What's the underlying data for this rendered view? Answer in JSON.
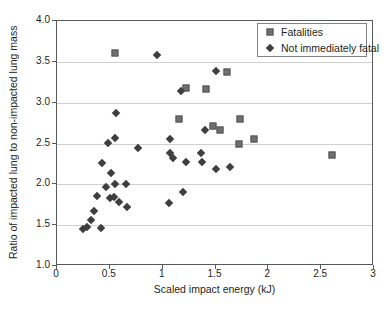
{
  "figure": {
    "background": "#ffffff",
    "frame_color": "#58595b",
    "gridline_color": "#cfcfcf",
    "text_color": "#231f20"
  },
  "chart_data": {
    "type": "scatter",
    "title": "",
    "xlabel": "Scaled impact energy (kJ)",
    "ylabel": "Ratio of impacted lung to non-impacted lung mass",
    "xlim": [
      0,
      3
    ],
    "ylim": [
      1.0,
      4.0
    ],
    "x_ticks": [
      0,
      0.5,
      1,
      1.5,
      2,
      2.5,
      3
    ],
    "x_tick_labels": [
      "0",
      "0.5",
      "1",
      "1.5",
      "2",
      "2.5",
      "3"
    ],
    "y_ticks": [
      1.0,
      1.5,
      2.0,
      2.5,
      3.0,
      3.5,
      4.0
    ],
    "y_tick_labels": [
      "1.0",
      "1.5",
      "2.0",
      "2.5",
      "3.0",
      "3.5",
      "4.0"
    ],
    "grid": "horizontal",
    "legend_position": "top-right",
    "series": [
      {
        "name": "Fatalities",
        "marker": "square",
        "color": "#6f6f6f",
        "border_color": "#565656",
        "points": [
          [
            0.55,
            3.61
          ],
          [
            1.22,
            3.18
          ],
          [
            1.41,
            3.17
          ],
          [
            1.61,
            3.38
          ],
          [
            1.15,
            2.8
          ],
          [
            1.48,
            2.71
          ],
          [
            1.54,
            2.66
          ],
          [
            1.73,
            2.8
          ],
          [
            1.72,
            2.5
          ],
          [
            1.86,
            2.56
          ],
          [
            2.6,
            2.36
          ]
        ]
      },
      {
        "name": "Not immediately fatal",
        "marker": "diamond",
        "color": "#3e3e3e",
        "border_color": "#3e3e3e",
        "points": [
          [
            0.95,
            3.58
          ],
          [
            1.5,
            3.39
          ],
          [
            1.17,
            3.14
          ],
          [
            0.56,
            2.87
          ],
          [
            0.55,
            2.57
          ],
          [
            0.48,
            2.51
          ],
          [
            0.77,
            2.45
          ],
          [
            1.07,
            2.55
          ],
          [
            1.4,
            2.66
          ],
          [
            1.07,
            2.38
          ],
          [
            1.1,
            2.32
          ],
          [
            1.22,
            2.28
          ],
          [
            1.36,
            2.38
          ],
          [
            1.37,
            2.27
          ],
          [
            1.5,
            2.19
          ],
          [
            1.64,
            2.21
          ],
          [
            0.43,
            2.26
          ],
          [
            0.51,
            2.14
          ],
          [
            0.46,
            1.97
          ],
          [
            0.55,
            2.0
          ],
          [
            0.65,
            2.0
          ],
          [
            0.38,
            1.86
          ],
          [
            0.5,
            1.83
          ],
          [
            0.54,
            1.84
          ],
          [
            0.59,
            1.78
          ],
          [
            0.66,
            1.72
          ],
          [
            0.35,
            1.68
          ],
          [
            0.32,
            1.56
          ],
          [
            0.25,
            1.45
          ],
          [
            0.28,
            1.48
          ],
          [
            0.42,
            1.47
          ],
          [
            1.06,
            1.77
          ],
          [
            1.19,
            1.91
          ]
        ]
      }
    ]
  }
}
